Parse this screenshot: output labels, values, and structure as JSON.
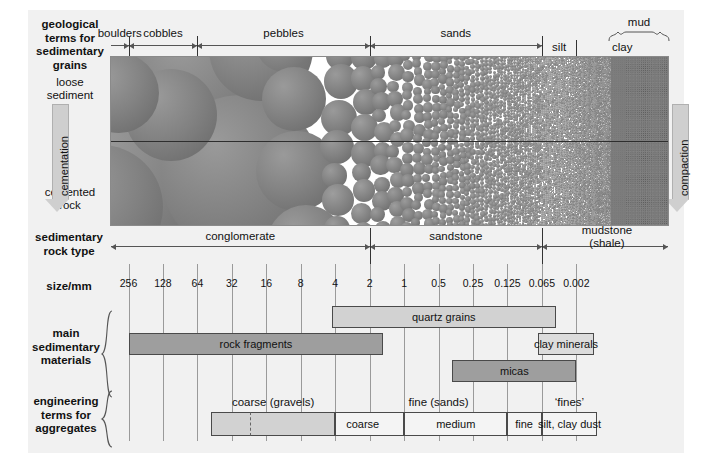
{
  "figure": {
    "background": "#f1f1f1"
  },
  "row_labels": {
    "geological_terms": "geological\nterms for\nsedimentary\ngrains",
    "sedimentary_rock_type": "sedimentary\nrock type",
    "size_axis": "size/mm",
    "main_materials": "main\nsedimentary\nmaterials",
    "engineering_terms": "engineering\nterms for\naggregates"
  },
  "process": {
    "top_state": "loose\nsediment",
    "bottom_state": "cemented\nrock",
    "left_arrow_label": "cementation",
    "right_arrow_label": "compaction"
  },
  "grain_terms": [
    {
      "label": "boulders",
      "from_mm": 256,
      "to_mm": 256
    },
    {
      "label": "cobbles",
      "from_mm": 256,
      "to_mm": 64
    },
    {
      "label": "pebbles",
      "from_mm": 64,
      "to_mm": 2
    },
    {
      "label": "sands",
      "from_mm": 2,
      "to_mm": 0.065
    },
    {
      "label": "silt",
      "from_mm": 0.065,
      "to_mm": 0.002
    },
    {
      "label": "clay",
      "from_mm": 0.002,
      "to_mm": 0.002
    }
  ],
  "mud_brace_label": "mud",
  "rock_types": [
    {
      "label": "conglomerate",
      "from_mm": 256,
      "to_mm": 2
    },
    {
      "label": "sandstone",
      "from_mm": 2,
      "to_mm": 0.065
    },
    {
      "label": "mudstone\n(shale)",
      "from_mm": 0.065,
      "to_mm": 0.002
    }
  ],
  "rock_type_lines": [
    "mudstone",
    "(shale)"
  ],
  "size_scale": {
    "unit": "mm",
    "ticks": [
      "256",
      "128",
      "64",
      "32",
      "16",
      "8",
      "4",
      "2",
      "1",
      "0.5",
      "0.25",
      "0.125",
      "0.065",
      "0.002"
    ]
  },
  "materials": [
    {
      "label": "rock fragments",
      "shade": "midgrey",
      "start_tick": 0,
      "end_tick": 7.4
    },
    {
      "label": "quartz grains",
      "shade": "lightgrey",
      "start_tick": 5.9,
      "end_tick": 12.4
    },
    {
      "label": "micas",
      "shade": "midgrey",
      "start_tick": 9.4,
      "end_tick": 13.0
    },
    {
      "label": "clay minerals",
      "shade": "palegrey",
      "start_tick": 11.9,
      "end_tick": 13.5
    }
  ],
  "engineering": {
    "group_labels": [
      {
        "label": "coarse (gravels)"
      },
      {
        "label": "fine (sands)"
      },
      {
        "label": "‘fines’"
      }
    ],
    "segments": [
      {
        "label": "",
        "shade": "lightgrey",
        "start_tick": 2.4,
        "end_tick": 3.55
      },
      {
        "label": "",
        "shade": "lightgrey",
        "start_tick": 3.55,
        "end_tick": 6.0
      },
      {
        "label": "coarse",
        "shade": "white",
        "start_tick": 6.0,
        "end_tick": 8.0
      },
      {
        "label": "medium",
        "shade": "white",
        "start_tick": 8.0,
        "end_tick": 11.0
      },
      {
        "label": "fine",
        "shade": "white",
        "start_tick": 11.0,
        "end_tick": 12.0
      },
      {
        "label": "silt, clay dust",
        "shade": "white",
        "start_tick": 12.0,
        "end_tick": 13.6
      }
    ]
  },
  "chart_data": {
    "type": "table",
    "xlabel": "size/mm",
    "x_ticks": [
      256,
      128,
      64,
      32,
      16,
      8,
      4,
      2,
      1,
      0.5,
      0.25,
      0.125,
      0.065,
      0.002
    ],
    "x_scale": "logarithmic (each tick = factor of 2, last two steps compressed)",
    "rows": [
      {
        "name": "geological terms for sedimentary grains",
        "bands": [
          {
            "label": "boulders",
            "range_mm": ">256"
          },
          {
            "label": "cobbles",
            "range_mm": "256–64"
          },
          {
            "label": "pebbles",
            "range_mm": "64–2"
          },
          {
            "label": "sands",
            "range_mm": "2–0.065"
          },
          {
            "label": "silt",
            "range_mm": "0.065–0.002"
          },
          {
            "label": "clay",
            "range_mm": "<0.002"
          },
          {
            "label": "mud",
            "range_mm": "0.065–<0.002 (silt + clay)"
          }
        ]
      },
      {
        "name": "sedimentary rock type",
        "bands": [
          {
            "label": "conglomerate",
            "range_mm": ">2"
          },
          {
            "label": "sandstone",
            "range_mm": "2–0.065"
          },
          {
            "label": "mudstone (shale)",
            "range_mm": "<0.065"
          }
        ]
      },
      {
        "name": "main sedimentary materials",
        "bands": [
          {
            "label": "rock fragments",
            "range_mm": ">256 to ~1.5"
          },
          {
            "label": "quartz grains",
            "range_mm": "~6 to ~0.05"
          },
          {
            "label": "micas",
            "range_mm": "~0.7 to ~0.03"
          },
          {
            "label": "clay minerals",
            "range_mm": "~0.1 to <0.002"
          }
        ]
      },
      {
        "name": "engineering terms for aggregates",
        "bands": [
          {
            "label": "coarse (gravels)",
            "range_mm": "~60 to 2"
          },
          {
            "label": "fine (sands)",
            "range_mm": "2 to 0.065"
          },
          {
            "label": "coarse (sand)",
            "range_mm": "2 to 0.5"
          },
          {
            "label": "medium (sand)",
            "range_mm": "0.5 to 0.125"
          },
          {
            "label": "fine (sand)",
            "range_mm": "0.125 to 0.065"
          },
          {
            "label": "‘fines’ / silt, clay dust",
            "range_mm": "<0.065"
          }
        ]
      }
    ],
    "process_axes": [
      {
        "label": "cementation",
        "direction": "downward",
        "from": "loose sediment",
        "to": "cemented rock",
        "side": "left"
      },
      {
        "label": "compaction",
        "direction": "downward",
        "side": "right"
      }
    ]
  }
}
